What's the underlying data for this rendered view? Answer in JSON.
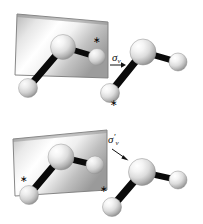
{
  "figure": {
    "title": "",
    "background": "#ffffff",
    "width": 203,
    "height": 224,
    "panels": [
      {
        "id": "panel-top",
        "name": "sigma-v-reflection-panel",
        "operation_label": {
          "symbol": "σ",
          "subscript": "v",
          "prime": "",
          "full": "σv"
        },
        "mirror_plane": {
          "name": "mirror-plane-sigma-v",
          "fill_light": "#ffffff",
          "fill_dark": "#9a9a9a",
          "edge_color": "#6d6d6d"
        },
        "molecules": [
          {
            "name": "molecule-original",
            "atoms": [
              {
                "label": "central",
                "marked": false
              },
              {
                "label": "right-terminal",
                "marked": true
              },
              {
                "label": "lower-left-terminal",
                "marked": false
              }
            ]
          },
          {
            "name": "molecule-reflected",
            "atoms": [
              {
                "label": "central",
                "marked": false
              },
              {
                "label": "right-terminal",
                "marked": false
              },
              {
                "label": "lower-left-terminal",
                "marked": true
              }
            ]
          }
        ],
        "markers": [
          {
            "name": "asterisk-marker-plane",
            "glyph": "∗"
          },
          {
            "name": "asterisk-marker-image",
            "glyph": "∗"
          }
        ]
      },
      {
        "id": "panel-bottom",
        "name": "sigma-v-prime-reflection-panel",
        "operation_label": {
          "symbol": "σ",
          "subscript": "v",
          "prime": "′",
          "full": "σv′"
        },
        "mirror_plane": {
          "name": "mirror-plane-sigma-v-prime",
          "fill_light": "#ffffff",
          "fill_dark": "#9a9a9a",
          "edge_color": "#6d6d6d"
        },
        "molecules": [
          {
            "name": "molecule-original",
            "atoms": [
              {
                "label": "central",
                "marked": false
              },
              {
                "label": "right-terminal",
                "marked": false
              },
              {
                "label": "lower-left-terminal",
                "marked": true
              }
            ]
          },
          {
            "name": "molecule-reflected",
            "atoms": [
              {
                "label": "central",
                "marked": false
              },
              {
                "label": "right-terminal",
                "marked": false
              },
              {
                "label": "lower-left-terminal",
                "marked": true
              }
            ]
          }
        ],
        "markers": [
          {
            "name": "asterisk-marker-plane",
            "glyph": "∗"
          },
          {
            "name": "asterisk-marker-image",
            "glyph": "∗"
          }
        ]
      }
    ],
    "colors": {
      "atom_highlight": "#ffffff",
      "atom_mid": "#d9d9d9",
      "atom_shadow": "#8c8c8c",
      "bond": "#0a0a0a",
      "arrow": "#111111"
    }
  }
}
